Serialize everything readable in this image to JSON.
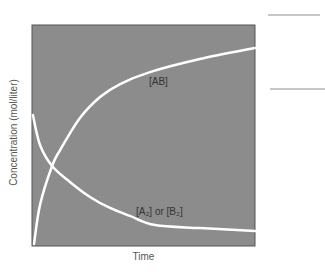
{
  "chart_data": {
    "type": "line",
    "title": "",
    "xlabel": "Time",
    "ylabel": "Concentration (mol/liter)",
    "xlim": [
      0,
      10
    ],
    "ylim": [
      0,
      10
    ],
    "grid": false,
    "legend": "none (inline curve labels)",
    "background_color": "#8c8c8c",
    "line_color": "#ffffff",
    "series": [
      {
        "name": "[AB]",
        "label": "[AB]",
        "x": [
          0.09,
          0.36,
          0.9,
          1.26,
          2.15,
          3.05,
          3.95,
          5.29,
          7.53,
          10.0
        ],
        "y": [
          0.09,
          1.86,
          3.62,
          4.34,
          5.79,
          6.74,
          7.33,
          7.87,
          8.46,
          8.96
        ]
      },
      {
        "name": "[A2] or [B2]",
        "label": "[A₂] or [B₂]",
        "x": [
          0.04,
          0.36,
          0.9,
          1.7,
          2.6,
          3.5,
          4.39,
          5.52,
          7.53,
          10.0
        ],
        "y": [
          5.93,
          4.57,
          3.62,
          2.9,
          2.22,
          1.72,
          1.36,
          0.95,
          0.81,
          0.68
        ]
      }
    ],
    "annotations": [
      {
        "text": "[AB]",
        "x": 5.0,
        "y": 7.2
      },
      {
        "text": "[A₂] or [B₂]",
        "x": 5.5,
        "y": 1.2
      }
    ]
  },
  "labels": {
    "xlabel": "Time",
    "ylabel": "Concentration (mol/liter)",
    "ab": "[AB]",
    "a2b2": "[A₂] or [B₂]"
  }
}
